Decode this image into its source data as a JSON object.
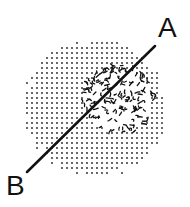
{
  "diagram": {
    "labels": {
      "a": "A",
      "b": "B"
    },
    "outer_region": {
      "description": "stippled dotted circular region",
      "cx": 95,
      "cy": 108,
      "rx": 73,
      "ry": 70,
      "dot_spacing": 5,
      "dot_radius": 0.9,
      "color": "#222222"
    },
    "inner_region": {
      "description": "dense squiggly clustered region",
      "cx": 118,
      "cy": 100,
      "rx": 38,
      "ry": 36,
      "color": "#111111"
    },
    "line": {
      "from_label": "B",
      "to_label": "A",
      "x1": 27,
      "y1": 172,
      "x2": 155,
      "y2": 46,
      "stroke_width": 2.5,
      "color": "#111111"
    }
  }
}
